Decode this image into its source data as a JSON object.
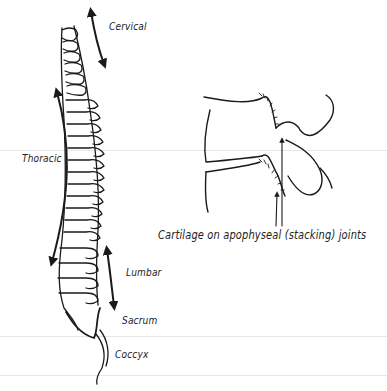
{
  "diagram": {
    "spine_labels": {
      "cervical": "Cervical",
      "thoracic": "Thoracic",
      "lumbar": "Lumbar",
      "sacrum": "Sacrum",
      "coccyx": "Coccyx"
    },
    "detail_caption": "Cartilage on apophyseal (stacking) joints",
    "colors": {
      "ink": "#1a1a1a",
      "paper": "#ffffff"
    }
  }
}
